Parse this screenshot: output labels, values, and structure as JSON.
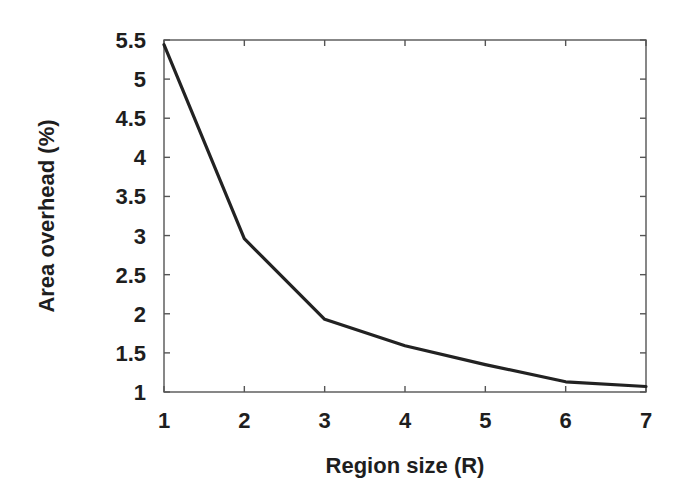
{
  "chart_data": {
    "type": "line",
    "title": "",
    "xlabel": "Region size (R)",
    "ylabel": "Area overhead (%)",
    "x": [
      1,
      2,
      3,
      4,
      5,
      6,
      7
    ],
    "series": [
      {
        "name": "Area overhead",
        "values": [
          5.44,
          2.96,
          1.93,
          1.59,
          1.35,
          1.13,
          1.07
        ],
        "color": "#222222"
      }
    ],
    "xlim": [
      1,
      7
    ],
    "ylim": [
      1,
      5.5
    ],
    "xticks": [
      "1",
      "2",
      "3",
      "4",
      "5",
      "6",
      "7"
    ],
    "yticks": [
      "1",
      "1.5",
      "2",
      "2.5",
      "3",
      "3.5",
      "4",
      "4.5",
      "5",
      "5.5"
    ],
    "grid": false,
    "legend": null
  },
  "style": {
    "line_color": "#222222",
    "axis_color": "#555555",
    "text_color": "#1e1e1e"
  }
}
